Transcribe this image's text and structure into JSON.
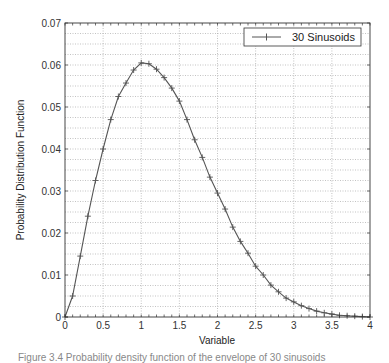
{
  "chart_data": {
    "type": "line",
    "title": "",
    "xlabel": "Variable",
    "ylabel": "Probability Distribution Function",
    "xlim": [
      0,
      4
    ],
    "ylim": [
      0,
      0.07
    ],
    "xticks": [
      0,
      0.5,
      1,
      1.5,
      2,
      2.5,
      3,
      3.5,
      4
    ],
    "xtick_labels": [
      "0",
      "0.5",
      "1",
      "1.5",
      "2",
      "2.5",
      "3",
      "3.5",
      "4"
    ],
    "yticks": [
      0,
      0.01,
      0.02,
      0.03,
      0.04,
      0.05,
      0.06,
      0.07
    ],
    "ytick_labels": [
      "0",
      "0.01",
      "0.02",
      "0.03",
      "0.04",
      "0.05",
      "0.06",
      "0.07"
    ],
    "grid": true,
    "y_minor_grid_step": 0.0025,
    "legend_position": "upper right",
    "series": [
      {
        "name": "30 Sinusoids",
        "color": "#555555",
        "marker": "+",
        "x": [
          0,
          0.1,
          0.2,
          0.3,
          0.4,
          0.5,
          0.6,
          0.7,
          0.8,
          0.9,
          1.0,
          1.1,
          1.2,
          1.3,
          1.4,
          1.5,
          1.6,
          1.7,
          1.8,
          1.9,
          2.0,
          2.1,
          2.2,
          2.3,
          2.4,
          2.5,
          2.6,
          2.7,
          2.8,
          2.9,
          3.0,
          3.1,
          3.2,
          3.3,
          3.4,
          3.5,
          3.6,
          3.7,
          3.8,
          3.9,
          4.0
        ],
        "values": [
          0,
          0.005,
          0.0145,
          0.024,
          0.0325,
          0.04,
          0.047,
          0.0525,
          0.0557,
          0.0588,
          0.0605,
          0.0603,
          0.059,
          0.057,
          0.0545,
          0.0514,
          0.047,
          0.0422,
          0.038,
          0.0333,
          0.0295,
          0.0257,
          0.0214,
          0.018,
          0.0152,
          0.0121,
          0.01,
          0.0076,
          0.006,
          0.0045,
          0.0036,
          0.0027,
          0.002,
          0.0014,
          0.001,
          0.0007,
          0.0004,
          0.0003,
          0.0002,
          0.0001,
          0
        ]
      }
    ]
  },
  "colors": {
    "axis": "#333333",
    "grid": "#9a9a9a",
    "line": "#555555",
    "background": "#ffffff"
  },
  "caption": "Figure 3.4 Probability density function of the envelope of 30 sinusoids"
}
